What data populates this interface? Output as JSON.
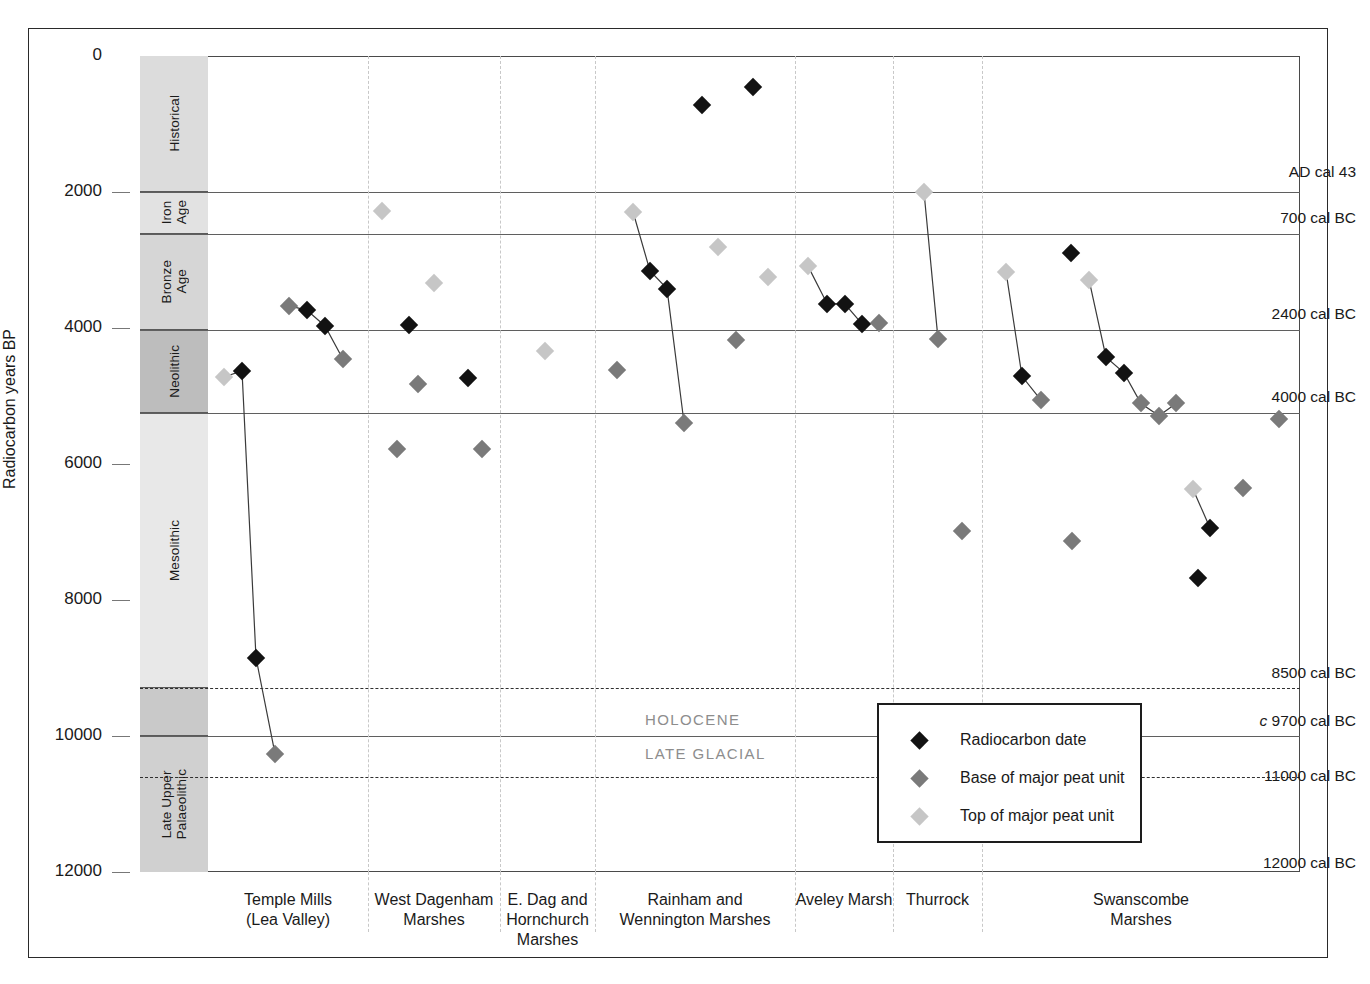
{
  "axis": {
    "y_title": "Radiocarbon years BP",
    "y_ticks": [
      "0",
      "2000",
      "4000",
      "6000",
      "8000",
      "10000",
      "12000"
    ]
  },
  "periods": [
    {
      "label": "Historical",
      "from": 0,
      "to": 2000
    },
    {
      "label": "Iron\nAge",
      "from": 2000,
      "to": 2620
    },
    {
      "label": "Bronze\nAge",
      "from": 2620,
      "to": 4030
    },
    {
      "label": "Neolithic",
      "from": 4030,
      "to": 5250
    },
    {
      "label": "Mesolithic",
      "from": 5250,
      "to": 9300
    },
    {
      "label": "",
      "from": 9300,
      "to": 10000
    },
    {
      "label": "Late Upper\nPalaeolithic",
      "from": 10000,
      "to": 12000
    }
  ],
  "calendar_labels": [
    {
      "text": "AD cal 43",
      "bp": 1720,
      "italic_prefix": ""
    },
    {
      "text": "700 cal BC",
      "bp": 2390,
      "italic_prefix": ""
    },
    {
      "text": "2400 cal BC",
      "bp": 3810,
      "italic_prefix": ""
    },
    {
      "text": "4000 cal BC",
      "bp": 5030,
      "italic_prefix": ""
    },
    {
      "text": "8500 cal BC",
      "bp": 9090,
      "italic_prefix": ""
    },
    {
      "text": "9700 cal BC",
      "bp": 9790,
      "italic_prefix": "c"
    },
    {
      "text": "11000 cal BC",
      "bp": 10600,
      "italic_prefix": ""
    },
    {
      "text": "12000 cal BC",
      "bp": 11880,
      "italic_prefix": ""
    }
  ],
  "epochs": [
    {
      "label": "HOLOCENE",
      "bp": 9780
    },
    {
      "label": "LATE GLACIAL",
      "bp": 10280
    }
  ],
  "legend": {
    "items": [
      {
        "label": "Radiocarbon date",
        "color": "#121212"
      },
      {
        "label": "Base of major peat unit",
        "color": "#7a7a7a"
      },
      {
        "label": "Top of major peat unit",
        "color": "#c6c6c6"
      }
    ]
  },
  "chart_data": {
    "type": "scatter",
    "title": "",
    "xlabel": "",
    "ylabel": "Radiocarbon years BP",
    "ylim": [
      0,
      12000
    ],
    "y_inverted": true,
    "grid": "horizontal period boundaries + dashed site dividers",
    "legend_position": "inside lower-right",
    "series": [
      {
        "name": "Radiocarbon date",
        "color": "#121212"
      },
      {
        "name": "Base of major peat unit",
        "color": "#7a7a7a"
      },
      {
        "name": "Top of major peat unit",
        "color": "#c6c6c6"
      }
    ],
    "sites": [
      {
        "name": "Temple Mills\n(Lea Valley)",
        "x0": 208,
        "x1": 368
      },
      {
        "name": "West Dagenham\nMarshes",
        "x0": 368,
        "x1": 500
      },
      {
        "name": "E. Dag and\nHornchurch\nMarshes",
        "x0": 500,
        "x1": 595
      },
      {
        "name": "Rainham and\nWennington Marshes",
        "x0": 595,
        "x1": 795
      },
      {
        "name": "Aveley Marsh",
        "x0": 795,
        "x1": 893
      },
      {
        "name": "Thurrock",
        "x0": 893,
        "x1": 982
      },
      {
        "name": "Swanscombe\nMarshes",
        "x0": 982,
        "x1": 1300
      }
    ],
    "points": [
      {
        "site": "Temple Mills",
        "x": 224,
        "bp": 4720,
        "type": "top"
      },
      {
        "site": "Temple Mills",
        "x": 242,
        "bp": 4630,
        "type": "date"
      },
      {
        "site": "Temple Mills",
        "x": 256,
        "bp": 8850,
        "type": "date"
      },
      {
        "site": "Temple Mills",
        "x": 275,
        "bp": 10260,
        "type": "base"
      },
      {
        "site": "Temple Mills",
        "x": 289,
        "bp": 3670,
        "type": "base"
      },
      {
        "site": "Temple Mills",
        "x": 307,
        "bp": 3740,
        "type": "date"
      },
      {
        "site": "Temple Mills",
        "x": 325,
        "bp": 3970,
        "type": "date"
      },
      {
        "site": "Temple Mills",
        "x": 343,
        "bp": 4460,
        "type": "base"
      },
      {
        "site": "West Dagenham",
        "x": 382,
        "bp": 2280,
        "type": "top"
      },
      {
        "site": "West Dagenham",
        "x": 434,
        "bp": 3340,
        "type": "top"
      },
      {
        "site": "West Dagenham",
        "x": 409,
        "bp": 3950,
        "type": "date"
      },
      {
        "site": "West Dagenham",
        "x": 418,
        "bp": 4830,
        "type": "base"
      },
      {
        "site": "West Dagenham",
        "x": 397,
        "bp": 5780,
        "type": "base"
      },
      {
        "site": "E. Dag and Hornchurch",
        "x": 545,
        "bp": 4340,
        "type": "top"
      },
      {
        "site": "E. Dag and Hornchurch",
        "x": 468,
        "bp": 4740,
        "type": "date"
      },
      {
        "site": "E. Dag and Hornchurch",
        "x": 482,
        "bp": 5780,
        "type": "base"
      },
      {
        "site": "Rainham and Wennington",
        "x": 702,
        "bp": 720,
        "type": "date"
      },
      {
        "site": "Rainham and Wennington",
        "x": 753,
        "bp": 450,
        "type": "date"
      },
      {
        "site": "Rainham and Wennington",
        "x": 633,
        "bp": 2290,
        "type": "top"
      },
      {
        "site": "Rainham and Wennington",
        "x": 650,
        "bp": 3160,
        "type": "date"
      },
      {
        "site": "Rainham and Wennington",
        "x": 667,
        "bp": 3420,
        "type": "date"
      },
      {
        "site": "Rainham and Wennington",
        "x": 684,
        "bp": 5390,
        "type": "base"
      },
      {
        "site": "Rainham and Wennington",
        "x": 718,
        "bp": 2810,
        "type": "top"
      },
      {
        "site": "Rainham and Wennington",
        "x": 768,
        "bp": 3250,
        "type": "top"
      },
      {
        "site": "Rainham and Wennington",
        "x": 736,
        "bp": 4170,
        "type": "base"
      },
      {
        "site": "Rainham and Wennington",
        "x": 617,
        "bp": 4620,
        "type": "base"
      },
      {
        "site": "Aveley Marsh",
        "x": 808,
        "bp": 3090,
        "type": "top"
      },
      {
        "site": "Aveley Marsh",
        "x": 827,
        "bp": 3640,
        "type": "date"
      },
      {
        "site": "Aveley Marsh",
        "x": 845,
        "bp": 3650,
        "type": "date"
      },
      {
        "site": "Aveley Marsh",
        "x": 862,
        "bp": 3940,
        "type": "date"
      },
      {
        "site": "Aveley Marsh",
        "x": 879,
        "bp": 3930,
        "type": "base"
      },
      {
        "site": "Thurrock",
        "x": 924,
        "bp": 2000,
        "type": "top"
      },
      {
        "site": "Thurrock",
        "x": 938,
        "bp": 4160,
        "type": "base"
      },
      {
        "site": "Thurrock",
        "x": 962,
        "bp": 6980,
        "type": "base"
      },
      {
        "site": "Swanscombe",
        "x": 1006,
        "bp": 3170,
        "type": "top"
      },
      {
        "site": "Swanscombe",
        "x": 1022,
        "bp": 4710,
        "type": "date"
      },
      {
        "site": "Swanscombe",
        "x": 1041,
        "bp": 5060,
        "type": "base"
      },
      {
        "site": "Swanscombe",
        "x": 1071,
        "bp": 2890,
        "type": "date"
      },
      {
        "site": "Swanscombe",
        "x": 1089,
        "bp": 3290,
        "type": "top"
      },
      {
        "site": "Swanscombe",
        "x": 1106,
        "bp": 4430,
        "type": "date"
      },
      {
        "site": "Swanscombe",
        "x": 1124,
        "bp": 4660,
        "type": "date"
      },
      {
        "site": "Swanscombe",
        "x": 1141,
        "bp": 5110,
        "type": "base"
      },
      {
        "site": "Swanscombe",
        "x": 1159,
        "bp": 5290,
        "type": "base"
      },
      {
        "site": "Swanscombe",
        "x": 1176,
        "bp": 5110,
        "type": "base"
      },
      {
        "site": "Swanscombe",
        "x": 1279,
        "bp": 5340,
        "type": "base"
      },
      {
        "site": "Swanscombe",
        "x": 1193,
        "bp": 6370,
        "type": "top"
      },
      {
        "site": "Swanscombe",
        "x": 1210,
        "bp": 6940,
        "type": "date"
      },
      {
        "site": "Swanscombe",
        "x": 1243,
        "bp": 6350,
        "type": "base"
      },
      {
        "site": "Swanscombe",
        "x": 1072,
        "bp": 7130,
        "type": "base"
      },
      {
        "site": "Swanscombe",
        "x": 1198,
        "bp": 7680,
        "type": "date"
      }
    ],
    "links": [
      [
        [
          224,
          4720
        ],
        [
          242,
          4630
        ],
        [
          256,
          8850
        ],
        [
          275,
          10260
        ]
      ],
      [
        [
          289,
          3670
        ],
        [
          307,
          3740
        ],
        [
          325,
          3970
        ],
        [
          343,
          4460
        ]
      ],
      [
        [
          633,
          2290
        ],
        [
          650,
          3160
        ],
        [
          667,
          3420
        ],
        [
          684,
          5390
        ]
      ],
      [
        [
          808,
          3090
        ],
        [
          827,
          3640
        ],
        [
          845,
          3650
        ],
        [
          862,
          3940
        ],
        [
          879,
          3930
        ]
      ],
      [
        [
          924,
          2000
        ],
        [
          938,
          4160
        ]
      ],
      [
        [
          1006,
          3170
        ],
        [
          1022,
          4710
        ],
        [
          1041,
          5060
        ]
      ],
      [
        [
          1089,
          3290
        ],
        [
          1106,
          4430
        ],
        [
          1124,
          4660
        ],
        [
          1141,
          5110
        ],
        [
          1159,
          5290
        ],
        [
          1176,
          5110
        ]
      ],
      [
        [
          1193,
          6370
        ],
        [
          1210,
          6940
        ]
      ]
    ]
  }
}
